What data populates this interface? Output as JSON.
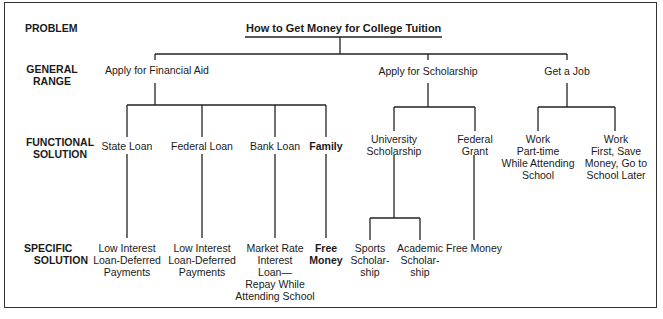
{
  "row_labels": {
    "problem": "PROBLEM",
    "general_range": [
      "GENERAL",
      "RANGE"
    ],
    "functional_solution": [
      "FUNCTIONAL",
      "SOLUTION"
    ],
    "specific_solution": [
      "SPECIFIC",
      "SOLUTION"
    ]
  },
  "problem": {
    "title": "How to Get Money for College Tuition"
  },
  "general_range": [
    {
      "label": "Apply for Financial Aid"
    },
    {
      "label": "Apply for Scholarship"
    },
    {
      "label": "Get a Job"
    }
  ],
  "functional_solution": {
    "financial_aid": [
      {
        "label": "State Loan"
      },
      {
        "label": "Federal Loan"
      },
      {
        "label": "Bank Loan"
      },
      {
        "label": "Family"
      }
    ],
    "scholarship": [
      {
        "lines": [
          "University",
          "Scholarship"
        ]
      },
      {
        "lines": [
          "Federal",
          "Grant"
        ]
      }
    ],
    "job": [
      {
        "lines": [
          "Work",
          "Part-time",
          "While Attending",
          "School"
        ]
      },
      {
        "lines": [
          "Work",
          "First, Save",
          "Money, Go to",
          "School Later"
        ]
      }
    ]
  },
  "specific_solution": {
    "state_loan": [
      "Low Interest",
      "Loan-Deferred",
      "Payments"
    ],
    "federal_loan": [
      "Low Interest",
      "Loan-Deferred",
      "Payments"
    ],
    "bank_loan": [
      "Market Rate",
      "Interest",
      "Loan—",
      "Repay While",
      "Attending School"
    ],
    "family": [
      "Free",
      "Money"
    ],
    "sports": [
      "Sports",
      "Scholar-",
      "ship"
    ],
    "academic": [
      "Academic",
      "Scholar-",
      "ship"
    ],
    "federal_grant": [
      "Free Money"
    ]
  }
}
